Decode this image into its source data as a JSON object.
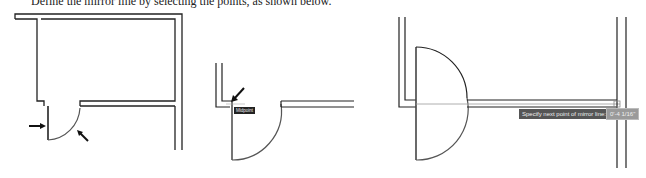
{
  "caption": "Define the mirror line by selecting the points, as shown below.",
  "figures": [
    {
      "name": "door-in-room",
      "arrows": 2
    },
    {
      "name": "first-point-snap",
      "snap_label": "Midpoint"
    },
    {
      "name": "second-point-prompt",
      "prompt": "Specify next point of mirror line:",
      "input_value": "0'-4 1/16\""
    }
  ],
  "colors": {
    "line": "#222222",
    "arc": "#555555",
    "tooltip_bg": "#555555",
    "input_bg": "#9a9a9a"
  }
}
